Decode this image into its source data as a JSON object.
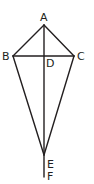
{
  "diagram": {
    "type": "kite-geometry",
    "stroke_color": "#231f20",
    "points": {
      "A": {
        "label": "A",
        "x": 44,
        "y": 25
      },
      "B": {
        "label": "B",
        "x": 13,
        "y": 56
      },
      "C": {
        "label": "C",
        "x": 74,
        "y": 56
      },
      "D": {
        "label": "D",
        "x": 44,
        "y": 56
      },
      "E": {
        "label": "E",
        "x": 44,
        "y": 155
      },
      "F": {
        "label": "F",
        "x": 44,
        "y": 177
      }
    },
    "segments": [
      "AB",
      "AC",
      "BE",
      "CE",
      "BC",
      "AF"
    ]
  }
}
